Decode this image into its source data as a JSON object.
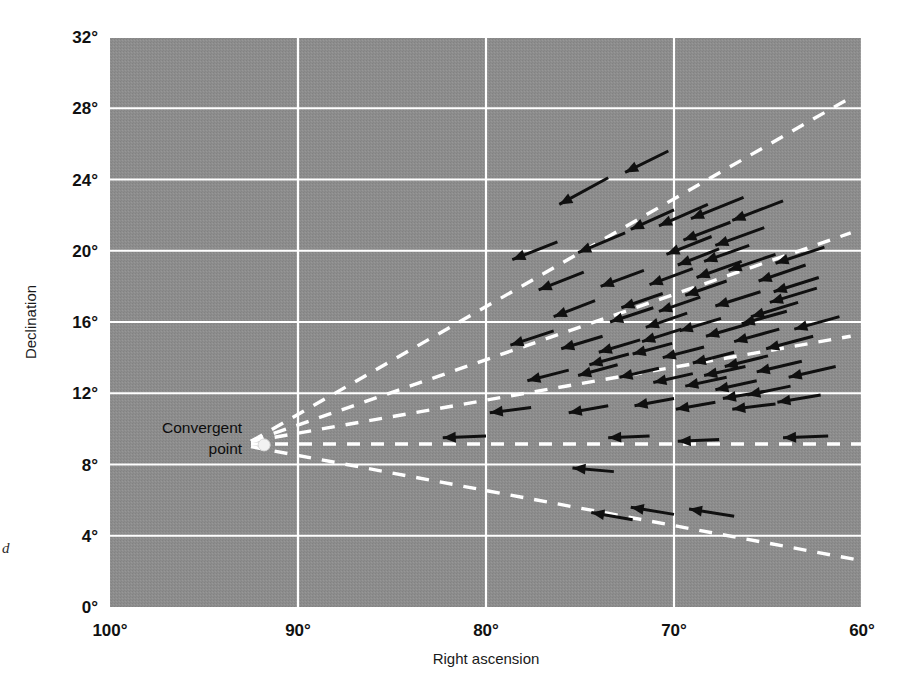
{
  "figure": {
    "title": "",
    "side_note": "d",
    "background_color": "#8b8b8b",
    "grid_color": "#ffffff",
    "arrow_color": "#101010",
    "dash_color": "#ffffff",
    "convergent_point_color": "#f2f2f2"
  },
  "axes": {
    "x": {
      "label": "Right ascension",
      "ticks": [
        "100°",
        "90°",
        "80°",
        "70°",
        "60°"
      ],
      "tick_values": [
        100,
        90,
        80,
        70,
        60
      ],
      "min": 60,
      "max": 100,
      "inverted": true
    },
    "y": {
      "label": "Declination",
      "ticks": [
        "0°",
        "4°",
        "8°",
        "12°",
        "16°",
        "20°",
        "24°",
        "28°",
        "32°"
      ],
      "tick_values": [
        0,
        4,
        8,
        12,
        16,
        20,
        24,
        28,
        32
      ],
      "min": 0,
      "max": 32
    }
  },
  "annotations": [
    {
      "name": "convergent-point",
      "line1": "Convergent",
      "line2": "point",
      "ra": 91.8,
      "dec": 9.1
    }
  ],
  "chart_data": {
    "type": "scatter",
    "title": "",
    "xlabel": "Right ascension",
    "ylabel": "Declination",
    "xlim": [
      100,
      60
    ],
    "ylim": [
      0,
      32
    ],
    "grid": true,
    "legend": "none",
    "convergent_point": {
      "ra": 91.8,
      "dec": 9.1
    },
    "convergence_lines": [
      {
        "name": "upper-1",
        "from": [
          92.5,
          9.3
        ],
        "to": [
          60.6,
          28.6
        ]
      },
      {
        "name": "upper-2",
        "from": [
          92.5,
          9.3
        ],
        "to": [
          60.6,
          21.0
        ]
      },
      {
        "name": "upper-3",
        "from": [
          92.5,
          9.3
        ],
        "to": [
          60.6,
          15.2
        ]
      },
      {
        "name": "horizontal",
        "from": [
          92.5,
          9.15
        ],
        "to": [
          60.0,
          9.15
        ]
      },
      {
        "name": "lower-1",
        "from": [
          92.5,
          9.0
        ],
        "to": [
          60.0,
          2.6
        ]
      }
    ],
    "vectors": [
      {
        "ra": 73.5,
        "dec": 24.1,
        "dx": -2.6,
        "dy": -1.5
      },
      {
        "ra": 70.3,
        "dec": 25.6,
        "dx": -2.3,
        "dy": -1.2
      },
      {
        "ra": 76.2,
        "dec": 20.5,
        "dx": -2.4,
        "dy": -1.0
      },
      {
        "ra": 72.6,
        "dec": 21.0,
        "dx": -2.5,
        "dy": -1.1
      },
      {
        "ra": 70.0,
        "dec": 22.3,
        "dx": -2.3,
        "dy": -1.1
      },
      {
        "ra": 68.2,
        "dec": 22.6,
        "dx": -2.6,
        "dy": -1.2
      },
      {
        "ra": 66.3,
        "dec": 23.0,
        "dx": -2.8,
        "dy": -1.2
      },
      {
        "ra": 64.2,
        "dec": 22.8,
        "dx": -2.7,
        "dy": -1.1
      },
      {
        "ra": 67.0,
        "dec": 21.6,
        "dx": -2.5,
        "dy": -1.0
      },
      {
        "ra": 65.2,
        "dec": 21.3,
        "dx": -2.6,
        "dy": -1.0
      },
      {
        "ra": 66.0,
        "dec": 20.3,
        "dx": -2.4,
        "dy": -0.9
      },
      {
        "ra": 67.6,
        "dec": 20.1,
        "dx": -2.2,
        "dy": -0.9
      },
      {
        "ra": 64.6,
        "dec": 19.8,
        "dx": -2.5,
        "dy": -0.9
      },
      {
        "ra": 62.0,
        "dec": 20.2,
        "dx": -2.6,
        "dy": -0.9
      },
      {
        "ra": 62.3,
        "dec": 18.5,
        "dx": -2.4,
        "dy": -0.8
      },
      {
        "ra": 74.8,
        "dec": 18.8,
        "dx": -2.4,
        "dy": -1.0
      },
      {
        "ra": 71.6,
        "dec": 18.9,
        "dx": -2.3,
        "dy": -0.9
      },
      {
        "ra": 69.0,
        "dec": 19.0,
        "dx": -2.3,
        "dy": -0.9
      },
      {
        "ra": 67.2,
        "dec": 18.3,
        "dx": -2.2,
        "dy": -0.8
      },
      {
        "ra": 65.4,
        "dec": 17.7,
        "dx": -2.4,
        "dy": -0.8
      },
      {
        "ra": 63.4,
        "dec": 17.1,
        "dx": -2.5,
        "dy": -0.8
      },
      {
        "ra": 74.2,
        "dec": 17.2,
        "dx": -2.2,
        "dy": -0.9
      },
      {
        "ra": 71.1,
        "dec": 16.8,
        "dx": -2.3,
        "dy": -0.8
      },
      {
        "ra": 69.3,
        "dec": 16.5,
        "dx": -2.2,
        "dy": -0.8
      },
      {
        "ra": 67.5,
        "dec": 16.2,
        "dx": -2.2,
        "dy": -0.7
      },
      {
        "ra": 66.0,
        "dec": 15.9,
        "dx": -2.3,
        "dy": -0.7
      },
      {
        "ra": 64.4,
        "dec": 15.6,
        "dx": -2.4,
        "dy": -0.7
      },
      {
        "ra": 62.6,
        "dec": 15.2,
        "dx": -2.5,
        "dy": -0.7
      },
      {
        "ra": 76.4,
        "dec": 15.5,
        "dx": -2.3,
        "dy": -0.8
      },
      {
        "ra": 73.8,
        "dec": 15.2,
        "dx": -2.2,
        "dy": -0.7
      },
      {
        "ra": 71.8,
        "dec": 15.0,
        "dx": -2.2,
        "dy": -0.7
      },
      {
        "ra": 70.1,
        "dec": 14.8,
        "dx": -2.1,
        "dy": -0.6
      },
      {
        "ra": 68.4,
        "dec": 14.6,
        "dx": -2.2,
        "dy": -0.6
      },
      {
        "ra": 66.8,
        "dec": 14.3,
        "dx": -2.2,
        "dy": -0.6
      },
      {
        "ra": 65.0,
        "dec": 14.1,
        "dx": -2.3,
        "dy": -0.6
      },
      {
        "ra": 63.2,
        "dec": 13.8,
        "dx": -2.4,
        "dy": -0.6
      },
      {
        "ra": 61.4,
        "dec": 13.5,
        "dx": -2.5,
        "dy": -0.6
      },
      {
        "ra": 75.6,
        "dec": 13.3,
        "dx": -2.2,
        "dy": -0.6
      },
      {
        "ra": 73.0,
        "dec": 13.6,
        "dx": -2.1,
        "dy": -0.6
      },
      {
        "ra": 70.8,
        "dec": 13.4,
        "dx": -2.1,
        "dy": -0.5
      },
      {
        "ra": 69.0,
        "dec": 13.1,
        "dx": -2.1,
        "dy": -0.5
      },
      {
        "ra": 67.2,
        "dec": 12.9,
        "dx": -2.2,
        "dy": -0.5
      },
      {
        "ra": 65.6,
        "dec": 12.7,
        "dx": -2.2,
        "dy": -0.5
      },
      {
        "ra": 63.8,
        "dec": 12.4,
        "dx": -2.3,
        "dy": -0.5
      },
      {
        "ra": 70.0,
        "dec": 11.7,
        "dx": -2.1,
        "dy": -0.4
      },
      {
        "ra": 67.8,
        "dec": 11.5,
        "dx": -2.1,
        "dy": -0.4
      },
      {
        "ra": 65.2,
        "dec": 12.1,
        "dx": -2.2,
        "dy": -0.4
      },
      {
        "ra": 62.2,
        "dec": 11.9,
        "dx": -2.3,
        "dy": -0.4
      },
      {
        "ra": 73.5,
        "dec": 11.3,
        "dx": -2.1,
        "dy": -0.4
      },
      {
        "ra": 77.6,
        "dec": 11.2,
        "dx": -2.2,
        "dy": -0.3
      },
      {
        "ra": 80.0,
        "dec": 9.6,
        "dx": -2.3,
        "dy": -0.1
      },
      {
        "ra": 71.3,
        "dec": 9.6,
        "dx": -2.2,
        "dy": -0.1
      },
      {
        "ra": 67.6,
        "dec": 9.4,
        "dx": -2.2,
        "dy": -0.1
      },
      {
        "ra": 61.8,
        "dec": 9.6,
        "dx": -2.4,
        "dy": -0.1
      },
      {
        "ra": 73.2,
        "dec": 7.6,
        "dx": -2.2,
        "dy": 0.2
      },
      {
        "ra": 70.0,
        "dec": 5.2,
        "dx": -2.3,
        "dy": 0.4
      },
      {
        "ra": 72.2,
        "dec": 4.9,
        "dx": -2.2,
        "dy": 0.4
      },
      {
        "ra": 66.8,
        "dec": 5.1,
        "dx": -2.4,
        "dy": 0.4
      },
      {
        "ra": 62.4,
        "dec": 17.9,
        "dx": -2.5,
        "dy": -0.8
      },
      {
        "ra": 61.2,
        "dec": 16.3,
        "dx": -2.4,
        "dy": -0.7
      },
      {
        "ra": 63.0,
        "dec": 19.2,
        "dx": -2.5,
        "dy": -0.9
      },
      {
        "ra": 68.6,
        "dec": 17.4,
        "dx": -2.2,
        "dy": -0.8
      },
      {
        "ra": 70.6,
        "dec": 17.6,
        "dx": -2.2,
        "dy": -0.8
      },
      {
        "ra": 66.4,
        "dec": 19.4,
        "dx": -2.4,
        "dy": -0.9
      },
      {
        "ra": 68.0,
        "dec": 20.8,
        "dx": -2.4,
        "dy": -1.0
      },
      {
        "ra": 64.0,
        "dec": 16.6,
        "dx": -2.4,
        "dy": -0.7
      },
      {
        "ra": 69.6,
        "dec": 15.6,
        "dx": -2.1,
        "dy": -0.7
      },
      {
        "ra": 72.4,
        "dec": 14.2,
        "dx": -2.1,
        "dy": -0.6
      },
      {
        "ra": 66.2,
        "dec": 13.5,
        "dx": -2.2,
        "dy": -0.5
      },
      {
        "ra": 64.6,
        "dec": 11.4,
        "dx": -2.3,
        "dy": -0.3
      }
    ]
  }
}
